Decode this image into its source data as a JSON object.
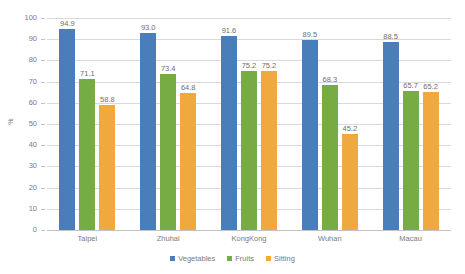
{
  "chart_data": {
    "type": "bar",
    "title": "",
    "subtitle": "",
    "xlabel": "",
    "ylabel": "%",
    "categories": [
      "Taipei",
      "Zhuhai",
      "KongKong",
      "Wuhan",
      "Macau"
    ],
    "series": [
      {
        "name": "Vegetables",
        "color": "#4a7ebb",
        "values": [
          94.9,
          93.0,
          91.6,
          89.5,
          88.5
        ],
        "labels": [
          "94.9",
          "93.0",
          "91.6",
          "89.5",
          "88.5"
        ]
      },
      {
        "name": "Fruits",
        "color": "#77ac44",
        "values": [
          71.1,
          73.4,
          75.2,
          68.3,
          65.7
        ],
        "labels": [
          "71.1",
          "73.4",
          "75.2",
          "68.3",
          "65.7"
        ]
      },
      {
        "name": "Sitting",
        "color": "#efa93e",
        "values": [
          58.8,
          64.8,
          75.2,
          45.2,
          65.2
        ],
        "labels": [
          "58.8",
          "64.8",
          "75.2",
          "45.2",
          "65.2"
        ]
      }
    ],
    "ylim": [
      0,
      100
    ],
    "ytick_step": 10,
    "yticks": [
      "100",
      "90",
      "80",
      "70",
      "60",
      "50",
      "40",
      "30",
      "20",
      "10",
      "0"
    ],
    "grid": true,
    "grid_axis": "y",
    "legend_position": "bottom",
    "data_labels": true,
    "background": "#ffffff",
    "grid_color": "#d9d9d9",
    "axis_color": "#c3c3c3",
    "text_color": "#7b7b7b"
  }
}
